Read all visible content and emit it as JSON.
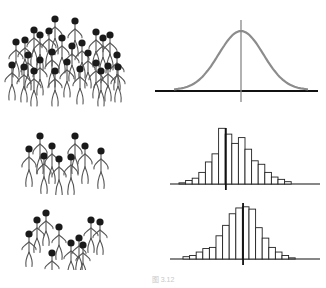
{
  "figure": {
    "caption": "图 3.12",
    "rows": [
      {
        "id": "population",
        "crowd_label": "population",
        "chart": "normal-curve"
      },
      {
        "id": "sample-1",
        "crowd_label": "sample 1",
        "chart": "histogram"
      },
      {
        "id": "sample-2",
        "crowd_label": "sample 2",
        "chart": "histogram"
      }
    ]
  },
  "chart_data": [
    {
      "type": "line",
      "title": "",
      "description": "Normal distribution curve of population with vertical mean line",
      "x": [
        -3,
        -2.5,
        -2,
        -1.5,
        -1,
        -0.5,
        0,
        0.5,
        1,
        1.5,
        2,
        2.5,
        3
      ],
      "values": [
        0.004,
        0.018,
        0.054,
        0.13,
        0.242,
        0.352,
        0.399,
        0.352,
        0.242,
        0.13,
        0.054,
        0.018,
        0.004
      ],
      "mean_line_x": 0,
      "color": "#8c8c8c"
    },
    {
      "type": "bar",
      "title": "",
      "description": "Sample 1 histogram, mean line slightly left of peak",
      "values": [
        1,
        3,
        5,
        10,
        19,
        26,
        48,
        43,
        35,
        40,
        30,
        20,
        17,
        10,
        6,
        4,
        2
      ],
      "mean_line_index": 7
    },
    {
      "type": "bar",
      "title": "",
      "description": "Sample 2 histogram, mean line near center",
      "values": [
        2,
        3,
        6,
        9,
        10,
        20,
        29,
        39,
        44,
        45,
        43,
        27,
        18,
        10,
        6,
        3,
        1
      ],
      "mean_line_index": 9
    }
  ]
}
